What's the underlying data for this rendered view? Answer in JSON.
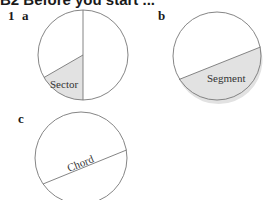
{
  "heading": {
    "text": "B2 Before you start ..."
  },
  "question": {
    "number": "1"
  },
  "panels": [
    {
      "label": "a",
      "term": "Sector"
    },
    {
      "label": "b",
      "term": "Segment"
    },
    {
      "label": "c",
      "term": "Chord"
    }
  ],
  "colors": {
    "stroke": "#777777",
    "shade": "#e2e2e2",
    "text": "#1a1a1a"
  }
}
